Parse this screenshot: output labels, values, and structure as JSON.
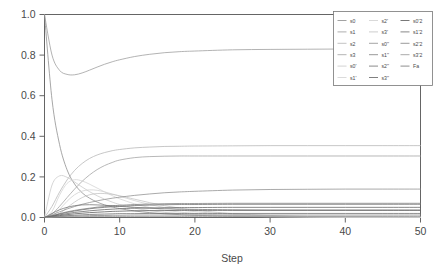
{
  "chart": {
    "type": "line",
    "title": "",
    "background": "#ffffff",
    "frame_color": "#555555"
  },
  "axes": {
    "x": {
      "label": "Step",
      "min": 0,
      "max": 50,
      "ticks": [
        "0",
        "10",
        "20",
        "30",
        "40",
        "50"
      ],
      "tick_values": [
        0,
        10,
        20,
        30,
        40,
        50
      ]
    },
    "y": {
      "label": "",
      "min": 0,
      "max": 1,
      "ticks": [
        "0.0",
        "0.2",
        "0.4",
        "0.6",
        "0.8",
        "1.0"
      ],
      "tick_values": [
        0,
        0.2,
        0.4,
        0.6,
        0.8,
        1.0
      ]
    }
  },
  "legend": {
    "position": "top-right",
    "columns": 3,
    "entries": [
      {
        "label": "s0",
        "color": "#8a8a8a"
      },
      {
        "label": "s1",
        "color": "#9a9a9a"
      },
      {
        "label": "s2",
        "color": "#b4b4b4"
      },
      {
        "label": "s3",
        "color": "#a0a0a0"
      },
      {
        "label": "s0'",
        "color": "#c8c8c8"
      },
      {
        "label": "s1'",
        "color": "#d2d2d2"
      },
      {
        "label": "s2'",
        "color": "#cfcfcf"
      },
      {
        "label": "s3'",
        "color": "#c2c2c2"
      },
      {
        "label": "s0''",
        "color": "#8e8e8e"
      },
      {
        "label": "s1''",
        "color": "#7d7d7d"
      },
      {
        "label": "s2''",
        "color": "#6e6e6e"
      },
      {
        "label": "s3''",
        "color": "#5f5f5f"
      },
      {
        "label": "s0'2",
        "color": "#565656"
      },
      {
        "label": "s1'2",
        "color": "#6a6a6a"
      },
      {
        "label": "s2'2",
        "color": "#818181"
      },
      {
        "label": "s3'2",
        "color": "#949494"
      },
      {
        "label": "Fa",
        "color": "#727272"
      }
    ]
  },
  "chart_data": {
    "type": "line",
    "title": "",
    "xlabel": "Step",
    "ylabel": "",
    "xlim": [
      0,
      50
    ],
    "ylim": [
      0,
      1
    ],
    "grid": false,
    "legend_position": "top-right",
    "x": [
      0,
      1,
      2,
      3,
      4,
      5,
      6,
      7,
      8,
      9,
      10,
      12,
      14,
      16,
      18,
      20,
      25,
      30,
      35,
      40,
      45,
      50
    ],
    "series": [
      {
        "name": "s0",
        "color": "#8a8a8a",
        "values": [
          1.0,
          0.58,
          0.36,
          0.235,
          0.165,
          0.122,
          0.095,
          0.076,
          0.062,
          0.052,
          0.044,
          0.032,
          0.024,
          0.018,
          0.014,
          0.011,
          0.006,
          0.003,
          0.002,
          0.001,
          0.001,
          0.0
        ]
      },
      {
        "name": "s1",
        "color": "#9a9a9a",
        "values": [
          1.0,
          0.8,
          0.725,
          0.705,
          0.703,
          0.712,
          0.726,
          0.741,
          0.755,
          0.767,
          0.777,
          0.793,
          0.804,
          0.812,
          0.817,
          0.82,
          0.826,
          0.828,
          0.829,
          0.83,
          0.83,
          0.83
        ]
      },
      {
        "name": "s2",
        "color": "#b4b4b4",
        "values": [
          0.0,
          0.055,
          0.125,
          0.185,
          0.232,
          0.266,
          0.291,
          0.308,
          0.32,
          0.329,
          0.335,
          0.343,
          0.347,
          0.35,
          0.351,
          0.352,
          0.353,
          0.354,
          0.354,
          0.354,
          0.354,
          0.354
        ]
      },
      {
        "name": "s3",
        "color": "#a0a0a0",
        "values": [
          0.0,
          0.018,
          0.055,
          0.098,
          0.14,
          0.178,
          0.21,
          0.236,
          0.256,
          0.271,
          0.283,
          0.295,
          0.3,
          0.302,
          0.303,
          0.303,
          0.303,
          0.303,
          0.303,
          0.303,
          0.303,
          0.303
        ]
      },
      {
        "name": "s0'",
        "color": "#c8c8c8",
        "values": [
          0.0,
          0.16,
          0.205,
          0.198,
          0.175,
          0.15,
          0.127,
          0.107,
          0.09,
          0.076,
          0.064,
          0.046,
          0.034,
          0.025,
          0.019,
          0.015,
          0.008,
          0.004,
          0.002,
          0.001,
          0.001,
          0.0
        ]
      },
      {
        "name": "s1'",
        "color": "#d2d2d2",
        "values": [
          0.0,
          0.03,
          0.11,
          0.168,
          0.186,
          0.18,
          0.164,
          0.145,
          0.126,
          0.108,
          0.092,
          0.067,
          0.049,
          0.036,
          0.027,
          0.02,
          0.01,
          0.005,
          0.003,
          0.002,
          0.001,
          0.001
        ]
      },
      {
        "name": "s2'",
        "color": "#cfcfcf",
        "values": [
          0.0,
          0.008,
          0.04,
          0.08,
          0.112,
          0.13,
          0.136,
          0.134,
          0.126,
          0.116,
          0.105,
          0.083,
          0.064,
          0.049,
          0.038,
          0.029,
          0.015,
          0.008,
          0.004,
          0.002,
          0.001,
          0.001
        ]
      },
      {
        "name": "s3'",
        "color": "#c2c2c2",
        "values": [
          0.0,
          0.003,
          0.02,
          0.048,
          0.076,
          0.098,
          0.112,
          0.118,
          0.118,
          0.114,
          0.107,
          0.09,
          0.073,
          0.058,
          0.046,
          0.036,
          0.019,
          0.01,
          0.005,
          0.003,
          0.002,
          0.001
        ]
      },
      {
        "name": "s0''",
        "color": "#8e8e8e",
        "values": [
          0.0,
          0.013,
          0.028,
          0.042,
          0.054,
          0.065,
          0.074,
          0.082,
          0.089,
          0.095,
          0.1,
          0.109,
          0.116,
          0.122,
          0.126,
          0.129,
          0.135,
          0.138,
          0.139,
          0.14,
          0.14,
          0.14
        ]
      },
      {
        "name": "s1''",
        "color": "#7d7d7d",
        "values": [
          0.0,
          0.009,
          0.019,
          0.028,
          0.035,
          0.041,
          0.046,
          0.051,
          0.054,
          0.058,
          0.06,
          0.064,
          0.066,
          0.068,
          0.069,
          0.069,
          0.07,
          0.07,
          0.07,
          0.07,
          0.07,
          0.07
        ]
      },
      {
        "name": "s2''",
        "color": "#6e6e6e",
        "values": [
          0.0,
          0.008,
          0.017,
          0.025,
          0.032,
          0.038,
          0.043,
          0.047,
          0.05,
          0.053,
          0.055,
          0.059,
          0.061,
          0.063,
          0.064,
          0.064,
          0.065,
          0.065,
          0.065,
          0.065,
          0.065,
          0.065
        ]
      },
      {
        "name": "s3''",
        "color": "#5f5f5f",
        "values": [
          0.0,
          0.006,
          0.013,
          0.019,
          0.025,
          0.029,
          0.033,
          0.036,
          0.039,
          0.041,
          0.043,
          0.046,
          0.047,
          0.048,
          0.049,
          0.049,
          0.05,
          0.05,
          0.05,
          0.05,
          0.05,
          0.05
        ]
      },
      {
        "name": "s0'2",
        "color": "#565656",
        "values": [
          0.0,
          0.004,
          0.009,
          0.014,
          0.018,
          0.021,
          0.024,
          0.026,
          0.028,
          0.03,
          0.031,
          0.033,
          0.034,
          0.034,
          0.035,
          0.035,
          0.035,
          0.035,
          0.035,
          0.035,
          0.035,
          0.035
        ]
      },
      {
        "name": "s1'2",
        "color": "#6a6a6a",
        "values": [
          0.0,
          0.003,
          0.006,
          0.009,
          0.011,
          0.013,
          0.015,
          0.016,
          0.017,
          0.018,
          0.019,
          0.019,
          0.02,
          0.02,
          0.02,
          0.02,
          0.02,
          0.02,
          0.02,
          0.02,
          0.02,
          0.02
        ]
      },
      {
        "name": "s2'2",
        "color": "#818181",
        "values": [
          0.0,
          0.002,
          0.004,
          0.006,
          0.007,
          0.008,
          0.009,
          0.01,
          0.01,
          0.011,
          0.011,
          0.012,
          0.012,
          0.012,
          0.012,
          0.012,
          0.012,
          0.012,
          0.012,
          0.012,
          0.012,
          0.012
        ]
      },
      {
        "name": "s3'2",
        "color": "#949494",
        "values": [
          0.0,
          0.001,
          0.002,
          0.003,
          0.004,
          0.004,
          0.005,
          0.005,
          0.005,
          0.005,
          0.005,
          0.005,
          0.005,
          0.005,
          0.005,
          0.005,
          0.005,
          0.005,
          0.005,
          0.005,
          0.005,
          0.005
        ]
      },
      {
        "name": "Fa",
        "color": "#727272",
        "values": [
          0.0,
          0.02,
          0.038,
          0.05,
          0.058,
          0.062,
          0.063,
          0.062,
          0.06,
          0.058,
          0.055,
          0.05,
          0.046,
          0.043,
          0.041,
          0.04,
          0.038,
          0.037,
          0.037,
          0.037,
          0.037,
          0.037
        ]
      }
    ]
  }
}
